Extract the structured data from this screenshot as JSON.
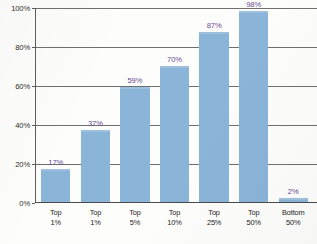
{
  "chart_data": {
    "type": "bar",
    "title": "",
    "subtitle": "",
    "xlabel": "",
    "ylabel": "",
    "categories": [
      "Top 1%",
      "Top 1%",
      "Top 5%",
      "Top 10%",
      "Top 25%",
      "Top 50%",
      "Bottom 50%"
    ],
    "category_lines": [
      [
        "Top",
        "1%"
      ],
      [
        "Top",
        "1%"
      ],
      [
        "Top",
        "5%"
      ],
      [
        "Top",
        "10%"
      ],
      [
        "Top",
        "25%"
      ],
      [
        "Top",
        "50%"
      ],
      [
        "Bottom",
        "50%"
      ]
    ],
    "values": [
      17,
      37,
      59,
      70,
      87,
      98,
      2
    ],
    "value_labels": [
      "17%",
      "37%",
      "59%",
      "70%",
      "87%",
      "98%",
      "2%"
    ],
    "ylim": [
      0,
      100
    ],
    "ytick_values": [
      0,
      20,
      40,
      60,
      80,
      100
    ],
    "ytick_labels": [
      "0%",
      "20%",
      "40%",
      "60%",
      "80%",
      "100%"
    ],
    "grid": true,
    "grid_axis": "y",
    "legend": false,
    "legend_position": "none",
    "colors": {
      "bar": "#8ab4d8",
      "value_label": "#6a4a96",
      "gridline": "#6f6f6f",
      "axis": "#4a4a4a",
      "tick_label": "#2d2d2d",
      "category_label": "#242424",
      "background": "#fdfdfc"
    }
  }
}
